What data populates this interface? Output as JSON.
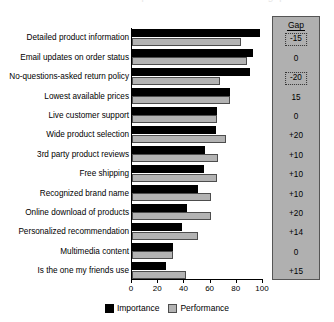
{
  "chart_data": {
    "type": "bar",
    "orientation": "horizontal",
    "title": "",
    "xlabel": "",
    "ylabel": "",
    "xlim": [
      0,
      100
    ],
    "xticks": [
      0,
      20,
      40,
      60,
      80,
      100
    ],
    "grid": false,
    "legend_position": "bottom-center",
    "categories": [
      "Detailed product information",
      "Email updates on order status",
      "No-questions-asked return policy",
      "Lowest available prices",
      "Live customer support",
      "Wide product selection",
      "3rd party product reviews",
      "Free shipping",
      "Recognized brand name",
      "Online download of products",
      "Personalized recommendation",
      "Multimedia content",
      "Is the one my friends use"
    ],
    "series": [
      {
        "name": "Importance",
        "color": "#000000",
        "values": [
          98,
          92,
          90,
          75,
          65,
          64,
          56,
          55,
          50,
          42,
          38,
          31,
          26
        ]
      },
      {
        "name": "Performance",
        "color": "#b3b3b3",
        "values": [
          83,
          88,
          67,
          75,
          65,
          72,
          66,
          65,
          60,
          60,
          50,
          31,
          41
        ]
      }
    ],
    "annotation_column": {
      "header": "Gap",
      "values": [
        "-15",
        "0",
        "-20",
        "15",
        "0",
        "+20",
        "+10",
        "+10",
        "+10",
        "+20",
        "+14",
        "0",
        "+15"
      ],
      "highlighted": [
        true,
        false,
        true,
        false,
        false,
        false,
        false,
        false,
        false,
        false,
        false,
        false,
        false
      ]
    }
  },
  "legend": [
    {
      "label": "Importance"
    },
    {
      "label": "Performance"
    }
  ],
  "title_strip": {
    "text": "Importance and Performance gap"
  }
}
